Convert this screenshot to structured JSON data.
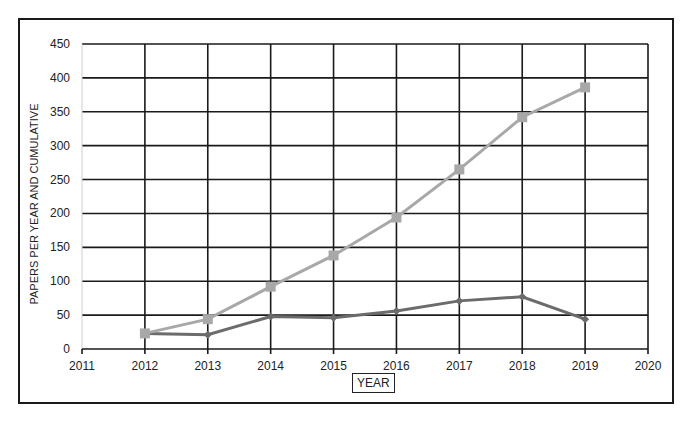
{
  "chart_data": {
    "type": "line",
    "title": "",
    "xlabel": "YEAR",
    "ylabel": "PAPERS PER YEAR AND CUMULATIVE",
    "x": [
      2012,
      2013,
      2014,
      2015,
      2016,
      2017,
      2018,
      2019
    ],
    "x_ticks": [
      2011,
      2012,
      2013,
      2014,
      2015,
      2016,
      2017,
      2018,
      2019,
      2020
    ],
    "y_ticks": [
      0,
      50,
      100,
      150,
      200,
      250,
      300,
      350,
      400,
      450
    ],
    "xlim": [
      2011,
      2020
    ],
    "ylim": [
      0,
      450
    ],
    "grid": true,
    "legend": null,
    "series": [
      {
        "name": "Papers per year",
        "marker": "diamond",
        "color": "#6b6b6b",
        "values": [
          23,
          21,
          48,
          46,
          56,
          71,
          77,
          44
        ]
      },
      {
        "name": "Cumulative",
        "marker": "square",
        "color": "#a8a8a8",
        "values": [
          23,
          44,
          92,
          138,
          194,
          265,
          342,
          386
        ]
      }
    ]
  }
}
